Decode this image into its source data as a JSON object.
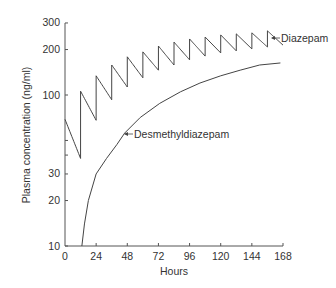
{
  "chart_data": {
    "type": "line",
    "title": "",
    "xlabel": "Hours",
    "ylabel": "Plasma concentration (ng/ml)",
    "xlim": [
      0,
      168
    ],
    "ylim": [
      10,
      300
    ],
    "yscale": "log",
    "x_ticks": [
      0,
      24,
      48,
      72,
      96,
      120,
      144,
      168
    ],
    "x_tick_labels": [
      "0",
      "24",
      "48",
      "72",
      "96",
      "120",
      "144",
      "168"
    ],
    "y_ticks": [
      10,
      20,
      30,
      40,
      50,
      100,
      200,
      300
    ],
    "y_tick_labels": {
      "10": "10",
      "20": "20",
      "30": "30",
      "100": "100",
      "200": "200",
      "300": "300"
    },
    "grid": false,
    "legend": "none (inline annotations)",
    "series": [
      {
        "name": "Diazepam",
        "dosing_interval_h": 12,
        "doses": [
          {
            "t": 0,
            "peak": 69,
            "trough": 38
          },
          {
            "t": 12,
            "peak": 106,
            "trough": 68
          },
          {
            "t": 24,
            "peak": 134,
            "trough": 93
          },
          {
            "t": 36,
            "peak": 158,
            "trough": 113
          },
          {
            "t": 48,
            "peak": 179,
            "trough": 130
          },
          {
            "t": 60,
            "peak": 193,
            "trough": 146
          },
          {
            "t": 72,
            "peak": 211,
            "trough": 158
          },
          {
            "t": 84,
            "peak": 224,
            "trough": 171
          },
          {
            "t": 96,
            "peak": 235,
            "trough": 181
          },
          {
            "t": 108,
            "peak": 242,
            "trough": 190
          },
          {
            "t": 120,
            "peak": 250,
            "trough": 196
          },
          {
            "t": 132,
            "peak": 254,
            "trough": 202
          },
          {
            "t": 144,
            "peak": 258,
            "trough": 208
          },
          {
            "t": 156,
            "peak": 266,
            "trough": 214
          }
        ]
      },
      {
        "name": "Desmethyldiazepam",
        "x": [
          13,
          15,
          18,
          24,
          32,
          40,
          46,
          58,
          73,
          89,
          104,
          120,
          135,
          150,
          166
        ],
        "values": [
          10,
          14,
          20,
          30,
          38,
          47,
          56,
          71,
          88,
          105,
          120,
          134,
          146,
          158,
          163
        ]
      }
    ],
    "annotations": [
      {
        "text": "Diazepam",
        "arrow_to": {
          "x": 158,
          "y": 250
        }
      },
      {
        "text": "Desmethyldiazepam",
        "arrow_to": {
          "x": 46,
          "y": 56
        }
      }
    ]
  }
}
